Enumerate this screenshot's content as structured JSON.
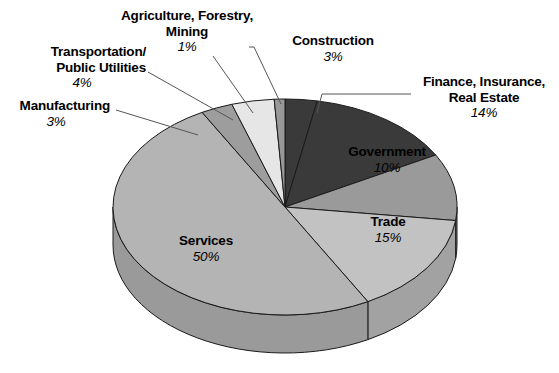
{
  "chart_data": {
    "type": "pie",
    "title": "",
    "subtitle": "",
    "xlabel": "",
    "ylabel": "",
    "legend_position": "callout-labels",
    "grid": false,
    "units": "percent",
    "total": 100,
    "categories": [
      "Construction",
      "Finance, Insurance, Real Estate",
      "Government",
      "Trade",
      "Services",
      "Manufacturing",
      "Transportation/Public Utilities",
      "Agriculture, Forestry, Mining"
    ],
    "values": [
      3,
      14,
      10,
      15,
      50,
      3,
      4,
      1
    ],
    "slices": [
      {
        "key": "construction",
        "label": "Construction",
        "label_line2": "",
        "pct_text": "3%",
        "value": 3,
        "start_pct": 0,
        "fill": "#3a3a3a",
        "side": "#262626",
        "label_placement": "callout"
      },
      {
        "key": "finance",
        "label": "Finance, Insurance,",
        "label_line2": "Real Estate",
        "pct_text": "14%",
        "value": 14,
        "start_pct": 3,
        "fill": "#3a3a3a",
        "side": "#262626",
        "label_placement": "callout"
      },
      {
        "key": "government",
        "label": "Government",
        "label_line2": "",
        "pct_text": "10%",
        "value": 10,
        "start_pct": 17,
        "fill": "#9a9a9a",
        "side": "#7d7d7d",
        "label_placement": "inside"
      },
      {
        "key": "trade",
        "label": "Trade",
        "label_line2": "",
        "pct_text": "15%",
        "value": 15,
        "start_pct": 27,
        "fill": "#c2c2c2",
        "side": "#a2a2a2",
        "label_placement": "inside"
      },
      {
        "key": "services",
        "label": "Services",
        "label_line2": "",
        "pct_text": "50%",
        "value": 50,
        "start_pct": 42,
        "fill": "#b4b4b4",
        "side": "#9a9a9a",
        "label_placement": "inside"
      },
      {
        "key": "manufacturing",
        "label": "Manufacturing",
        "label_line2": "",
        "pct_text": "3%",
        "value": 3,
        "start_pct": 92,
        "fill": "#9d9d9d",
        "side": "#828282",
        "label_placement": "callout"
      },
      {
        "key": "transportation",
        "label": "Transportation/",
        "label_line2": "Public Utilities",
        "pct_text": "4%",
        "value": 4,
        "start_pct": 95,
        "fill": "#e6e6e6",
        "side": "#c4c4c4",
        "label_placement": "callout"
      },
      {
        "key": "agriculture",
        "label": "Agriculture, Forestry,",
        "label_line2": "Mining",
        "pct_text": "1%",
        "value": 1,
        "start_pct": 99,
        "fill": "#989898",
        "side": "#7e7e7e",
        "label_placement": "callout"
      }
    ],
    "colors": {
      "dark_slice": "#3a3a3a",
      "mid_slice": "#9a9a9a",
      "light_slice": "#c2c2c2",
      "services_slice": "#b4b4b4",
      "pale_slice": "#e6e6e6",
      "outline": "#1a1a1a",
      "background": "#ffffff",
      "text": "#000000",
      "leader_line": "#555555"
    }
  },
  "labels": {
    "agriculture": {
      "line1": "Agriculture, Forestry,",
      "line2": "Mining",
      "pct": "1%"
    },
    "transportation": {
      "line1": "Transportation/",
      "line2": "Public Utilities",
      "pct": "4%"
    },
    "manufacturing": {
      "line1": "Manufacturing",
      "line2": "",
      "pct": "3%"
    },
    "construction": {
      "line1": "Construction",
      "line2": "",
      "pct": "3%"
    },
    "finance": {
      "line1": "Finance, Insurance,",
      "line2": "Real Estate",
      "pct": "14%"
    },
    "government": {
      "line1": "Government",
      "line2": "",
      "pct": "10%"
    },
    "trade": {
      "line1": "Trade",
      "line2": "",
      "pct": "15%"
    },
    "services": {
      "line1": "Services",
      "line2": "",
      "pct": "50%"
    }
  }
}
